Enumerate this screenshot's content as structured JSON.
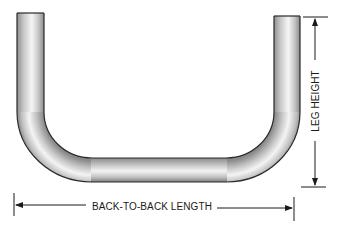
{
  "diagram": {
    "type": "u-bend-pipe-dimension",
    "labels": {
      "leg_height": "LEG HEIGHT",
      "back_to_back_length": "BACK-TO-BACK LENGTH"
    },
    "colors": {
      "pipe_outline": "#2a2a2a",
      "pipe_highlight": "#f4f4f4",
      "pipe_shadow": "#8a8a8a",
      "dimension_line": "#1a1a1a",
      "background": "#ffffff"
    }
  }
}
